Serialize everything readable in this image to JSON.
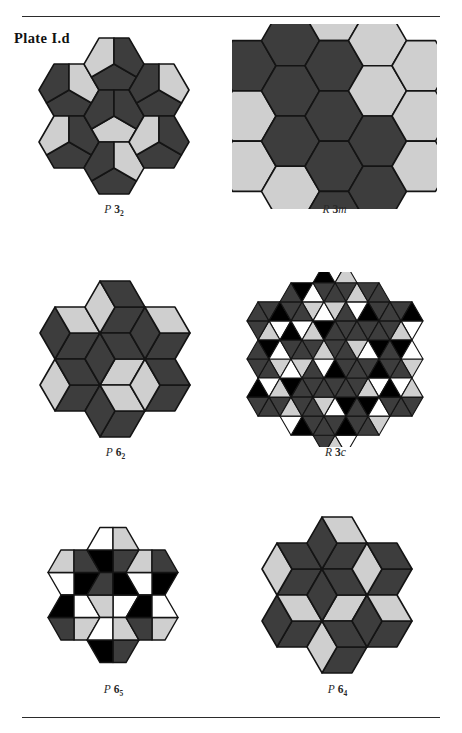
{
  "plate": {
    "label": "Plate I.d"
  },
  "rules": {
    "top_present": true,
    "bottom_present": true
  },
  "palette": {
    "dark": "#3d3d3d",
    "light": "#cfcfcf",
    "black": "#000000",
    "white": "#ffffff",
    "outline": "#141414",
    "background": "#ffffff",
    "text": "#1a1a1a"
  },
  "figures": [
    {
      "id": "p32",
      "caption_prefix": "P",
      "caption_number": "3",
      "caption_subscript": "2",
      "caption_suffix": "",
      "caption_full": "P 3₂",
      "tiling": "hexagon-pinwheel-pentagons",
      "pieces_per_hexagon": 3,
      "colors_used": [
        "dark",
        "dark",
        "light"
      ],
      "row": 1,
      "column": 1
    },
    {
      "id": "r3m",
      "caption_prefix": "R",
      "caption_number": "3",
      "caption_subscript": "",
      "caption_suffix": "m",
      "caption_full": "R 3m",
      "tiling": "plain-hexagon-honeycomb",
      "pieces_per_hexagon": 1,
      "colors_used": [
        "dark",
        "light"
      ],
      "row": 1,
      "column": 2
    },
    {
      "id": "p62",
      "caption_prefix": "P",
      "caption_number": "6",
      "caption_subscript": "2",
      "caption_suffix": "",
      "caption_full": "P 6₂",
      "tiling": "hexagon-three-rhombi-cube",
      "pieces_per_hexagon": 3,
      "colors_used": [
        "dark",
        "dark",
        "light"
      ],
      "row": 2,
      "column": 1
    },
    {
      "id": "r3c",
      "caption_prefix": "R",
      "caption_number": "3",
      "caption_subscript": "",
      "caption_suffix": "c",
      "caption_full": "R 3c",
      "tiling": "hexagon-six-triangles",
      "pieces_per_hexagon": 6,
      "colors_used": [
        "dark",
        "black",
        "white",
        "light"
      ],
      "row": 2,
      "column": 2
    },
    {
      "id": "p65",
      "caption_prefix": "P",
      "caption_number": "6",
      "caption_subscript": "5",
      "caption_suffix": "",
      "caption_full": "P 6₅",
      "tiling": "hexagon-four-quads",
      "pieces_per_hexagon": 4,
      "colors_used": [
        "white",
        "light",
        "dark",
        "black"
      ],
      "row": 3,
      "column": 1
    },
    {
      "id": "p64",
      "caption_prefix": "P",
      "caption_number": "6",
      "caption_subscript": "4",
      "caption_suffix": "",
      "caption_full": "P 6₄",
      "tiling": "hexagon-three-rhombi-cube",
      "pieces_per_hexagon": 3,
      "colors_used": [
        "dark",
        "dark",
        "light"
      ],
      "row": 3,
      "column": 2
    }
  ]
}
